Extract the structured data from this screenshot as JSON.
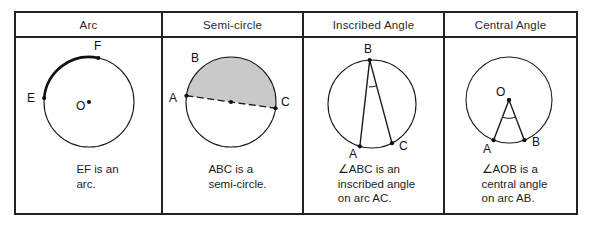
{
  "table": {
    "columns": [
      {
        "id": "arc",
        "header": "Arc",
        "caption": "EF is an\narc.",
        "figure": {
          "type": "circle-with-bold-arc",
          "center_label": "O",
          "points": [
            {
              "label": "E",
              "angle_deg": 185
            },
            {
              "label": "F",
              "angle_deg": 78
            }
          ],
          "bold_arc_from": "E",
          "bold_arc_to": "F"
        }
      },
      {
        "id": "semi-circle",
        "header": "Semi-circle",
        "caption": "ABC is a\nsemi-circle.",
        "figure": {
          "type": "circle-with-shaded-half",
          "points": [
            {
              "label": "A",
              "angle_deg": 188
            },
            {
              "label": "B",
              "angle_deg": 128
            },
            {
              "label": "C",
              "angle_deg": 8
            }
          ],
          "diameter": "AC",
          "diameter_style": "dashed",
          "shaded_half": "upper",
          "shade_color": "#c9c9c9",
          "center_marked": true
        }
      },
      {
        "id": "inscribed-angle",
        "header": "Inscribed Angle",
        "caption": "∠ABC is an\ninscribed angle\non arc AC.",
        "figure": {
          "type": "circle-with-inscribed-angle",
          "points": [
            {
              "label": "B",
              "angle_deg": 93
            },
            {
              "label": "A",
              "angle_deg": 254
            },
            {
              "label": "C",
              "angle_deg": 297
            }
          ],
          "vertex": "B",
          "rays_to": [
            "A",
            "C"
          ],
          "angle_mark_at": "B"
        }
      },
      {
        "id": "central-angle",
        "header": "Central Angle",
        "caption": "∠AOB is a\ncentral angle\non arc AB.",
        "figure": {
          "type": "circle-with-central-angle",
          "center_label": "O",
          "points": [
            {
              "label": "A",
              "angle_deg": 249
            },
            {
              "label": "B",
              "angle_deg": 291
            }
          ],
          "vertex": "O",
          "rays_to": [
            "A",
            "B"
          ],
          "angle_mark_at": "O"
        }
      }
    ]
  },
  "colors": {
    "border": "#222222",
    "ink": "#1a1a1a",
    "shade": "#c9c9c9",
    "background": "#ffffff"
  }
}
